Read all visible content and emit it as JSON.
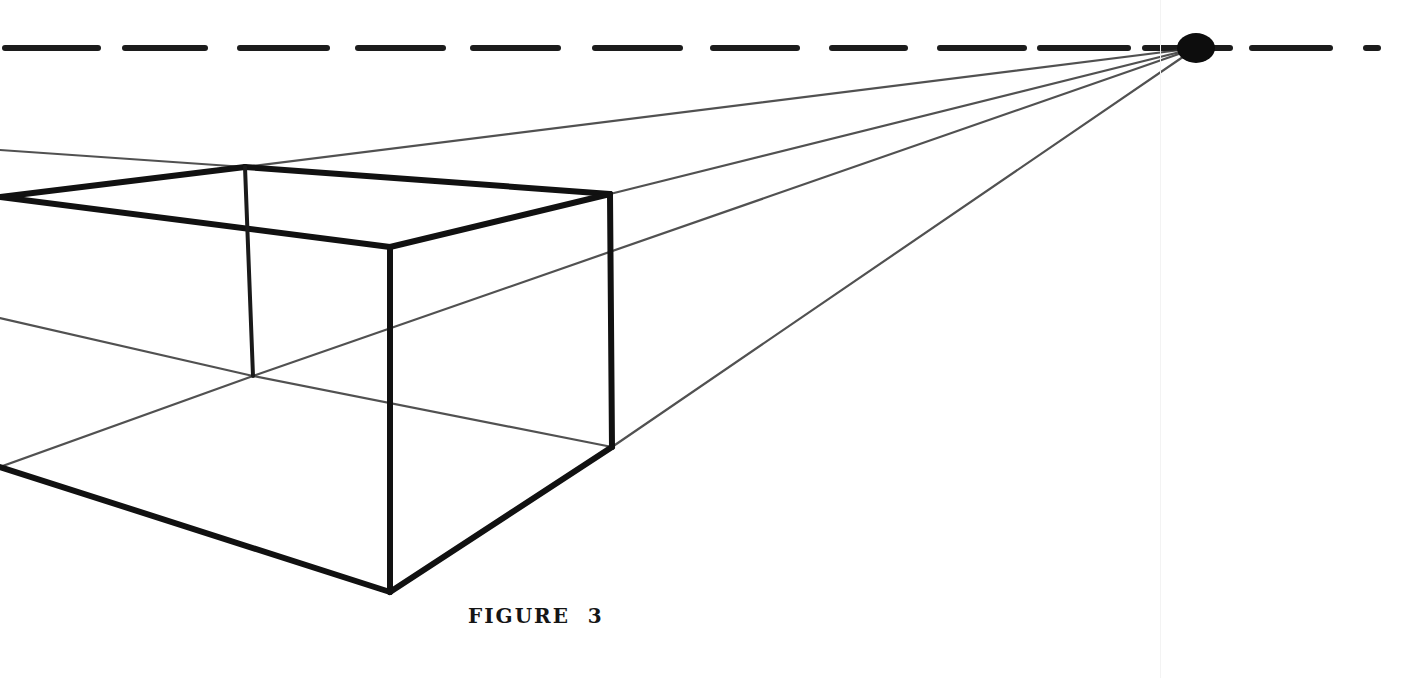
{
  "figure": {
    "caption": "FIGURE  3",
    "type": "one-point-perspective"
  },
  "horizon": {
    "y": 48,
    "dashes": [
      [
        5,
        98
      ],
      [
        125,
        205
      ],
      [
        240,
        327
      ],
      [
        358,
        443
      ],
      [
        473,
        558
      ],
      [
        595,
        680
      ],
      [
        713,
        797
      ],
      [
        832,
        905
      ],
      [
        940,
        1024
      ],
      [
        1040,
        1128
      ],
      [
        1145,
        1230
      ],
      [
        1252,
        1330
      ],
      [
        1366,
        1378
      ]
    ]
  },
  "vanishing_point": {
    "x": 1196,
    "y": 48,
    "rx": 19,
    "ry": 15
  },
  "box": {
    "vertices": {
      "left_top": [
        0,
        197
      ],
      "left_bottom": [
        0,
        467
      ],
      "back_top": [
        245,
        167
      ],
      "back_bottom": [
        253,
        376
      ],
      "near_top": [
        390,
        247
      ],
      "near_bottom": [
        390,
        592
      ],
      "right_top": [
        610,
        194
      ],
      "right_bottom": [
        612,
        447
      ]
    }
  },
  "guide_lines": [
    {
      "from": [
        0,
        150
      ],
      "to": [
        245,
        167
      ]
    },
    {
      "from": [
        245,
        167
      ],
      "to": [
        1196,
        48
      ]
    },
    {
      "from": [
        610,
        194
      ],
      "to": [
        1196,
        48
      ]
    },
    {
      "from": [
        0,
        318
      ],
      "to": [
        253,
        376
      ]
    },
    {
      "from": [
        253,
        376
      ],
      "to": [
        612,
        447
      ]
    },
    {
      "from": [
        0,
        467
      ],
      "to": [
        253,
        376
      ]
    },
    {
      "from": [
        253,
        376
      ],
      "to": [
        1196,
        48
      ]
    },
    {
      "from": [
        612,
        447
      ],
      "to": [
        1196,
        48
      ]
    }
  ]
}
